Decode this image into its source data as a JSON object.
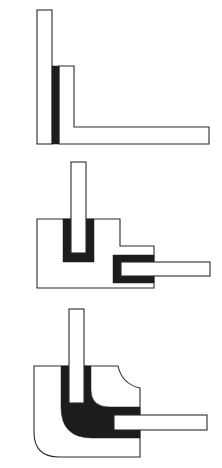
{
  "diagram": {
    "title": "",
    "colors": {
      "background": "#ffffff",
      "outline": "#2a2a2a",
      "fill": "#1c1c1c"
    },
    "figures": [
      {
        "id": "joint-1",
        "label": "",
        "kind": "simple lap L-joint"
      },
      {
        "id": "joint-2",
        "label": "",
        "kind": "stepped block with U-channel sockets"
      },
      {
        "id": "joint-3",
        "label": "",
        "kind": "rounded corner block with filleted socket"
      }
    ]
  }
}
